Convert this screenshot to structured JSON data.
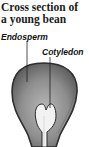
{
  "title": {
    "line1": "Cross section of",
    "line2": "a young bean"
  },
  "labels": {
    "endosperm": "Endosperm",
    "cotyledon": "Cotyledon"
  },
  "colors": {
    "seed_coat": "#3a3a3a",
    "endosperm_fill": "#8a8a8a",
    "cotyledon_fill": "#f2f2f2",
    "text": "#111111"
  }
}
